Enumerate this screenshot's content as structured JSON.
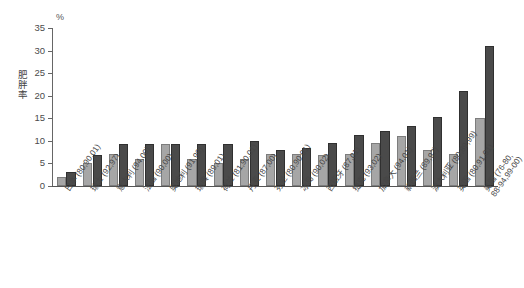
{
  "chart_data": {
    "type": "bar",
    "title": "",
    "xlabel": "",
    "ylabel": "肥胖率",
    "unit_label": "%",
    "ylim": [
      0,
      35
    ],
    "yticks": [
      0,
      5,
      10,
      15,
      20,
      25,
      30,
      35
    ],
    "grid": false,
    "legend": "none",
    "categories": [
      "日本 (80,90,01)",
      "瑞士 (92,97)",
      "意大利 (94,00)",
      "法国 (90,00)",
      "奥地利 (91,99)",
      "瑞典 (89,01)",
      "荷兰 (81,90,01)",
      "丹麦 (87,00)",
      "芬兰 (80,90,01)",
      "冰岛 (90,02)",
      "西班牙 (87,01)",
      "捷克 (93,02)",
      "加拿大 (94,01)",
      "新西兰 (89,97)",
      "澳大利亚 (80,89,99)",
      "英国 (80,91,01)",
      "美国 (76-80,\n88-94,99-00)"
    ],
    "series": [
      {
        "name": "早期年份",
        "color": "#a6a6a6",
        "values": [
          2.0,
          5.0,
          7.0,
          6.0,
          9.2,
          6.0,
          5.0,
          6.0,
          7.0,
          7.2,
          6.8,
          7.0,
          9.5,
          11.0,
          8.0,
          7.0,
          15.0
        ]
      },
      {
        "name": "近期年份",
        "color": "#4a4a4a",
        "values": [
          3.0,
          6.8,
          9.2,
          9.2,
          9.2,
          9.2,
          9.2,
          10.0,
          8.0,
          8.5,
          9.5,
          11.2,
          12.2,
          13.2,
          15.2,
          21.0,
          31.0
        ]
      }
    ],
    "values_light": [
      2.0,
      5.0,
      7.0,
      6.0,
      9.2,
      6.0,
      5.0,
      6.0,
      7.0,
      7.2,
      6.8,
      7.0,
      9.5,
      11.0,
      8.0,
      7.0,
      15.0
    ],
    "values_dark": [
      3.0,
      6.8,
      9.2,
      9.2,
      9.2,
      9.2,
      9.2,
      10.0,
      8.0,
      8.5,
      9.5,
      11.2,
      12.2,
      13.2,
      15.2,
      21.0,
      31.0
    ],
    "note": "Only 15 category slots rendered along axis; labels as listed"
  },
  "axis": {
    "unit": "%",
    "y_title": "肥胖率",
    "ticks": [
      "0",
      "5",
      "10",
      "15",
      "20",
      "25",
      "30",
      "35"
    ]
  },
  "colors": {
    "series1": "#a6a6a6",
    "series2": "#4a4a4a",
    "axis": "#555555",
    "text": "#454545",
    "background": "#ffffff"
  }
}
